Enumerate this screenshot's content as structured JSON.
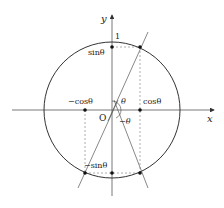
{
  "labels": {
    "y_axis": "y",
    "x_axis": "x",
    "origin": "O",
    "one": "1",
    "sin": "sinθ",
    "neg_sin": "−sinθ",
    "cos": "cosθ",
    "neg_cos": "−cosθ",
    "theta": "θ",
    "neg_theta": "−θ"
  },
  "colors": {
    "line": "#333333",
    "dashed": "#777777"
  }
}
